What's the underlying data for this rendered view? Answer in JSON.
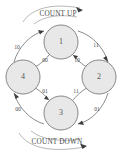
{
  "diagram": {
    "type": "state-transition-diagram",
    "title_top": "COUNT UP",
    "title_bottom": "COUNT DOWN",
    "colors": {
      "node_fill": "#e8e8e8",
      "node_stroke": "#7a7a7a",
      "edge_stroke": "#6f6f6f",
      "text": "#4a4a4a",
      "arrowhead": "#3d3d3d",
      "background": "#ffffff"
    },
    "states": [
      {
        "id": "s1",
        "label": "1",
        "position": "top",
        "cx": 61,
        "cy": 42,
        "r": 17
      },
      {
        "id": "s2",
        "label": "2",
        "position": "right",
        "cx": 99,
        "cy": 77,
        "r": 17
      },
      {
        "id": "s3",
        "label": "3",
        "position": "bottom",
        "cx": 61,
        "cy": 113,
        "r": 17
      },
      {
        "id": "s4",
        "label": "4",
        "position": "left",
        "cx": 23,
        "cy": 77,
        "r": 17
      }
    ],
    "transitions": [
      {
        "id": "t-4-1",
        "from": "4",
        "to": "1",
        "label": "10",
        "side": "outer-upper-left",
        "lx": 17,
        "ly": 48
      },
      {
        "id": "t-1-2",
        "from": "1",
        "to": "2",
        "label": "11",
        "side": "outer-upper-right",
        "lx": 96,
        "ly": 46
      },
      {
        "id": "t-2-3",
        "from": "2",
        "to": "3",
        "label": "01",
        "side": "outer-lower-right",
        "lx": 97,
        "ly": 110
      },
      {
        "id": "t-3-4",
        "from": "3",
        "to": "4",
        "label": "00",
        "side": "outer-lower-left",
        "lx": 18,
        "ly": 110
      },
      {
        "id": "t-1-4",
        "from": "1",
        "to": "4",
        "label": "00",
        "side": "inner-upper-left",
        "lx": 45,
        "ly": 61
      },
      {
        "id": "t-2-1",
        "from": "2",
        "to": "1",
        "label": "10",
        "side": "inner-upper-right",
        "lx": 77,
        "ly": 61
      },
      {
        "id": "t-4-3",
        "from": "4",
        "to": "3",
        "label": "01",
        "side": "inner-lower-left",
        "lx": 45,
        "ly": 92
      },
      {
        "id": "t-3-2",
        "from": "3",
        "to": "2",
        "label": "11",
        "side": "inner-lower-right",
        "lx": 76,
        "ly": 92
      }
    ],
    "banners": [
      {
        "id": "banner-up",
        "label": "COUNT UP",
        "x": 61,
        "y": 13,
        "direction": "clockwise"
      },
      {
        "id": "banner-down",
        "label": "COUNT DOWN",
        "x": 61,
        "y": 142,
        "direction": "clockwise"
      }
    ]
  }
}
